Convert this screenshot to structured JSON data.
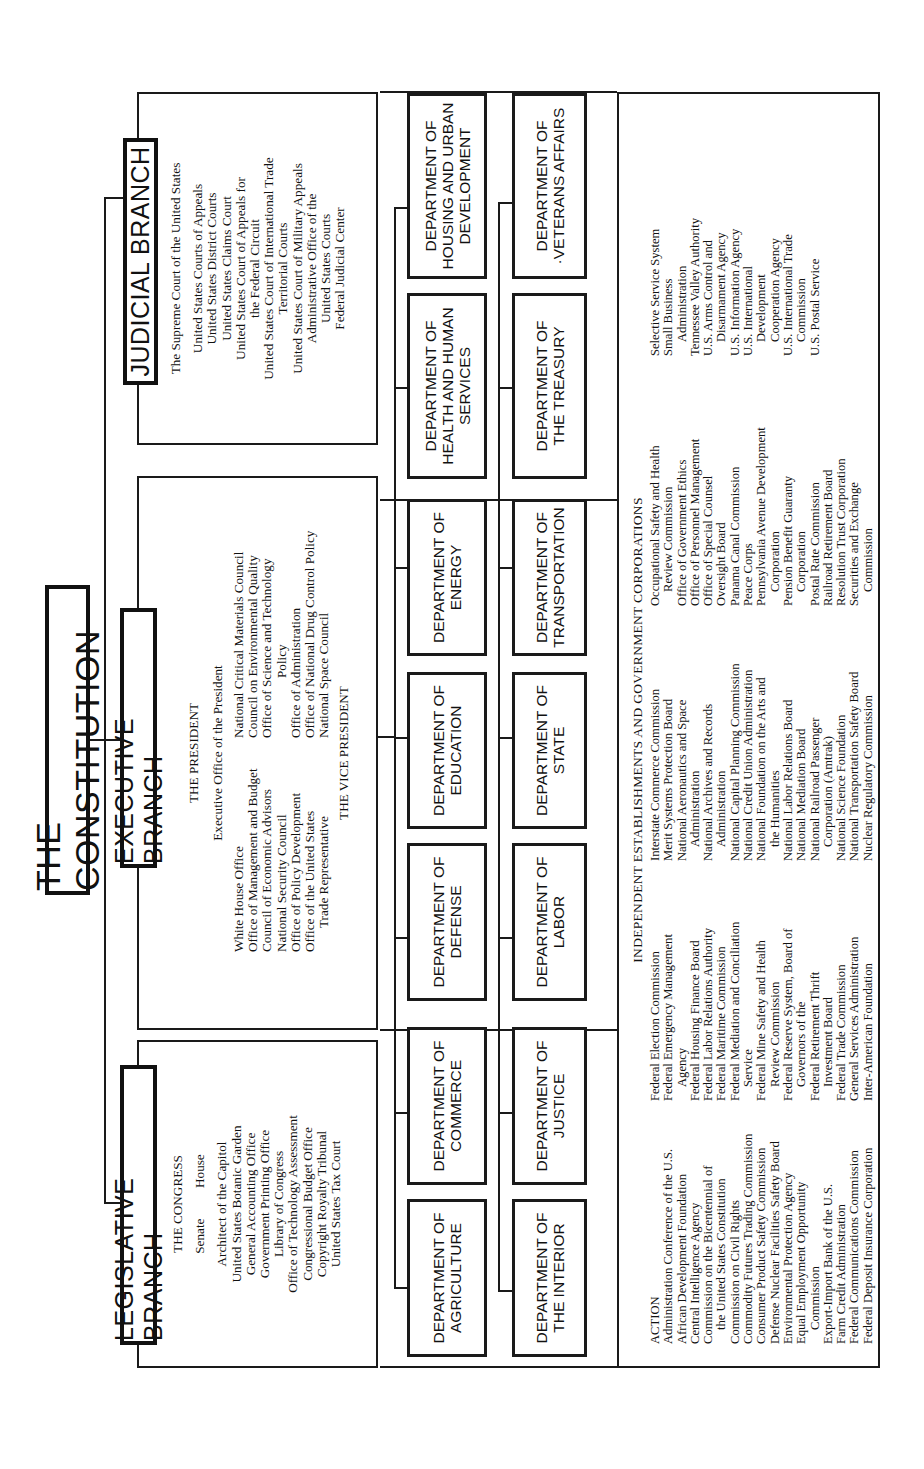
{
  "title": "THE CONSTITUTION",
  "branches": {
    "legislative": {
      "label": "LEGISLATIVE BRANCH",
      "head": "THE CONGRESS",
      "chambers": [
        "Senate",
        "House"
      ],
      "items": [
        "Architect of the Capitol",
        "United States Botanic Garden",
        "General Accounting Office",
        "Government Printing Office",
        "Library of Congress",
        "Office of Technology Assessment",
        "Congressional Budget Office",
        "Copyright Royalty Tribunal",
        "United States Tax Court"
      ]
    },
    "executive": {
      "label": "EXECUTIVE BRANCH",
      "head": "THE PRESIDENT",
      "office": "Executive Office of the President",
      "left_items": [
        "White House Office",
        "Office of Management and Budget",
        "Council of Economic Advisors",
        "National Security Council",
        "Office of Policy Development",
        "Office of the United States",
        "Trade Representative"
      ],
      "right_items": [
        "National Critical Materials Council",
        "Council on Environmental Quality",
        "Office of Science and Technology",
        "Policy",
        "Office of Administration",
        "Office of National Drug Control Policy",
        "National Space Council"
      ],
      "vice": "THE VICE PRESIDENT"
    },
    "judicial": {
      "label": "JUDICIAL BRANCH",
      "head": "The Supreme Court of the United States",
      "items": [
        "United States Courts of Appeals",
        "United States District Courts",
        "United States Claims Court",
        "United States Court of Appeals for",
        "the Federal Circuit",
        "United States Court of International Trade",
        "Territorial Courts",
        "United States Court of Military Appeals",
        "Administrative Office of the",
        "United States Courts",
        "Federal Judicial Center"
      ]
    }
  },
  "departments": {
    "row1": [
      "DEPARTMENT OF\nAGRICULTURE",
      "DEPARTMENT OF\nCOMMERCE",
      "DEPARTMENT OF\nDEFENSE",
      "DEPARTMENT OF\nEDUCATION",
      "DEPARTMENT OF\nENERGY",
      "DEPARTMENT OF\nHEALTH AND HUMAN\nSERVICES",
      "DEPARTMENT OF\nHOUSING AND URBAN\nDEVELOPMENT"
    ],
    "row2": [
      "DEPARTMENT OF\nTHE INTERIOR",
      "DEPARTMENT OF\nJUSTICE",
      "DEPARTMENT OF\nLABOR",
      "DEPARTMENT OF\nSTATE",
      "DEPARTMENT OF\nTRANSPORTATION",
      "DEPARTMENT OF\nTHE TREASURY",
      "DEPARTMENT OF\n·VETERANS AFFAIRS"
    ]
  },
  "independent": {
    "heading": "INDEPENDENT ESTABLISHMENTS AND GOVERNMENT CORPORATIONS",
    "columns": [
      [
        {
          "t": "ACTION",
          "i": 0
        },
        {
          "t": "Administration Conference of the U.S.",
          "i": 0
        },
        {
          "t": "African Development Foundation",
          "i": 0
        },
        {
          "t": "Central Intelligence Agency",
          "i": 0
        },
        {
          "t": "Commission on the Bicentennial of",
          "i": 0
        },
        {
          "t": "the United States Constitution",
          "i": 1
        },
        {
          "t": "Commission on Civil Rights",
          "i": 0
        },
        {
          "t": "Commodity Futures Trading Commission",
          "i": 0
        },
        {
          "t": "Consumer Product Safety Commission",
          "i": 0
        },
        {
          "t": "Defense Nuclear Facilities Safety Board",
          "i": 0
        },
        {
          "t": "Environmental Protection Agency",
          "i": 0
        },
        {
          "t": "Equal Employment Opportunity",
          "i": 0
        },
        {
          "t": "Commission",
          "i": 1
        },
        {
          "t": "Export-Import Bank of the U.S.",
          "i": 0
        },
        {
          "t": "Farm Credit Administration",
          "i": 0
        },
        {
          "t": "Federal Communications Commission",
          "i": 0
        },
        {
          "t": "Federal Deposit Insurance Corporation",
          "i": 0
        }
      ],
      [
        {
          "t": "Federal Election Commission",
          "i": 0
        },
        {
          "t": "Federal Emergency Management",
          "i": 0
        },
        {
          "t": "Agency",
          "i": 1
        },
        {
          "t": "Federal Housing Finance Board",
          "i": 0
        },
        {
          "t": "Federal Labor Relations Authority",
          "i": 0
        },
        {
          "t": "Federal Maritime Commission",
          "i": 0
        },
        {
          "t": "Federal Mediation and Conciliation",
          "i": 0
        },
        {
          "t": "Service",
          "i": 1
        },
        {
          "t": "Federal Mine Safety and Health",
          "i": 0
        },
        {
          "t": "Review Commission",
          "i": 1
        },
        {
          "t": "Federal Reserve System, Board of",
          "i": 0
        },
        {
          "t": "Governors of the",
          "i": 1
        },
        {
          "t": "Federal Retirement Thrift",
          "i": 0
        },
        {
          "t": "Investment Board",
          "i": 1
        },
        {
          "t": "Federal Trade Commission",
          "i": 0
        },
        {
          "t": "General Services Administration",
          "i": 0
        },
        {
          "t": "Inter-American Foundation",
          "i": 0
        }
      ],
      [
        {
          "t": "Interstate Commerce Commission",
          "i": 0
        },
        {
          "t": "Merit Systems Protection Board",
          "i": 0
        },
        {
          "t": "National Aeronautics and Space",
          "i": 0
        },
        {
          "t": "Administration",
          "i": 1
        },
        {
          "t": "National Archives and Records",
          "i": 0
        },
        {
          "t": "Administration",
          "i": 1
        },
        {
          "t": "National Capital Planning Commission",
          "i": 0
        },
        {
          "t": "National Credit Union Administration",
          "i": 0
        },
        {
          "t": "National Foundation on the Arts and",
          "i": 0
        },
        {
          "t": "the Humanities",
          "i": 1
        },
        {
          "t": "National Labor Relations Board",
          "i": 0
        },
        {
          "t": "National Mediation Board",
          "i": 0
        },
        {
          "t": "National Railroad Passenger",
          "i": 0
        },
        {
          "t": "Corporation (Amtrak)",
          "i": 1
        },
        {
          "t": "National Science Foundation",
          "i": 0
        },
        {
          "t": "National Transportation Safety Board",
          "i": 0
        },
        {
          "t": "Nuclear Regulatory Commission",
          "i": 0
        }
      ],
      [
        {
          "t": "Occupational Safety and Health",
          "i": 0
        },
        {
          "t": "Review Commission",
          "i": 1
        },
        {
          "t": "Office of Government Ethics",
          "i": 0
        },
        {
          "t": "Office of Personnel Management",
          "i": 0
        },
        {
          "t": "Office of Special Counsel",
          "i": 0
        },
        {
          "t": "Oversight Board",
          "i": 0
        },
        {
          "t": "Panama Canal Commission",
          "i": 0
        },
        {
          "t": "Peace Corps",
          "i": 0
        },
        {
          "t": "Pennsylvania Avenue Development",
          "i": 0
        },
        {
          "t": "Corporation",
          "i": 1
        },
        {
          "t": "Pension Benefit Guaranty",
          "i": 0
        },
        {
          "t": "Corporation",
          "i": 1
        },
        {
          "t": "Postal Rate Commission",
          "i": 0
        },
        {
          "t": "Railroad Retirement Board",
          "i": 0
        },
        {
          "t": "Resolution Trust Corporation",
          "i": 0
        },
        {
          "t": "Securities and Exchange",
          "i": 0
        },
        {
          "t": "Commission",
          "i": 1
        }
      ],
      [
        {
          "t": "Selective Service System",
          "i": 0
        },
        {
          "t": "Small Business",
          "i": 0
        },
        {
          "t": "Administration",
          "i": 1
        },
        {
          "t": "Tennessee Valley Authority",
          "i": 0
        },
        {
          "t": "U.S. Arms Control and",
          "i": 0
        },
        {
          "t": "Disarmament Agency",
          "i": 1
        },
        {
          "t": "U.S. Information Agency",
          "i": 0
        },
        {
          "t": "U.S. International",
          "i": 0
        },
        {
          "t": "Development",
          "i": 1
        },
        {
          "t": "Cooperation Agency",
          "i": 1
        },
        {
          "t": "U.S. International Trade",
          "i": 0
        },
        {
          "t": "Commission",
          "i": 1
        },
        {
          "t": "U.S. Postal Service",
          "i": 0
        }
      ]
    ]
  },
  "colors": {
    "ink": "#111111",
    "paper": "#ffffff"
  }
}
